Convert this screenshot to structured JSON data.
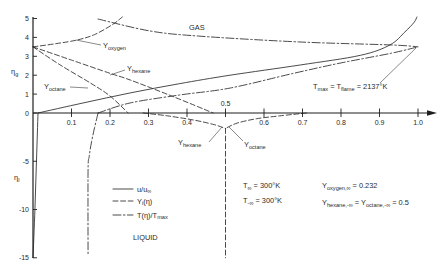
{
  "chart_data": {
    "type": "line",
    "title": "",
    "xlabel": "",
    "ylabel": "η",
    "ylabel_gas": {
      "main": "η",
      "sub": "g"
    },
    "ylabel_liquid": {
      "main": "η",
      "sub": "l"
    },
    "xlim": [
      0,
      1.0
    ],
    "ylim": [
      -15,
      5
    ],
    "grid": false,
    "legend_position": "lower-left-center",
    "x_ticks": [
      {
        "value": 0.1,
        "label": "0.1"
      },
      {
        "value": 0.2,
        "label": "0.2"
      },
      {
        "value": 0.3,
        "label": "0.3"
      },
      {
        "value": 0.4,
        "label": "0.4"
      },
      {
        "value": 0.5,
        "label": "0.5",
        "label_above": true
      },
      {
        "value": 0.6,
        "label": "0.6"
      },
      {
        "value": 0.7,
        "label": "0.7"
      },
      {
        "value": 0.8,
        "label": "0.8"
      },
      {
        "value": 0.9,
        "label": "0.9"
      },
      {
        "value": 1.0,
        "label": "1.0"
      }
    ],
    "y_ticks": [
      {
        "value": 5,
        "label": "5"
      },
      {
        "value": 4,
        "label": "4"
      },
      {
        "value": 3,
        "label": "3"
      },
      {
        "value": 2,
        "label": "2"
      },
      {
        "value": 1,
        "label": "1"
      },
      {
        "value": 0,
        "label": "0"
      },
      {
        "value": -5,
        "label": "-5"
      },
      {
        "value": -10,
        "label": "-10"
      },
      {
        "value": -15,
        "label": "-15"
      }
    ],
    "series": [
      {
        "name": "u/u∞ (gas)",
        "style": "solid",
        "points": [
          [
            0.013,
            0
          ],
          [
            0.13,
            0.53
          ],
          [
            0.252,
            1.06
          ],
          [
            0.38,
            1.55
          ],
          [
            0.512,
            2.0
          ],
          [
            0.694,
            2.54
          ],
          [
            0.85,
            3.05
          ],
          [
            0.927,
            3.6
          ],
          [
            0.966,
            4.29
          ],
          [
            0.99,
            4.8
          ],
          [
            0.997,
            5.08
          ]
        ]
      },
      {
        "name": "u/u∞ (liquid)",
        "style": "solid",
        "points": [
          [
            0.013,
            0
          ],
          [
            0.009,
            -5
          ],
          [
            0.005,
            -10
          ],
          [
            0.0,
            -15
          ]
        ]
      },
      {
        "name": "T(η)/Tmax (gas, above flame)",
        "style": "dashdot",
        "points": [
          [
            0.169,
            4.97
          ],
          [
            0.304,
            4.34
          ],
          [
            0.43,
            4.07
          ],
          [
            0.69,
            3.76
          ],
          [
            0.93,
            3.6
          ],
          [
            1.0,
            3.5
          ]
        ]
      },
      {
        "name": "T(η)/Tmax (gas, below flame)",
        "style": "dashdot",
        "points": [
          [
            0.169,
            0
          ],
          [
            0.252,
            0.53
          ],
          [
            0.38,
            0.95
          ],
          [
            0.512,
            1.32
          ],
          [
            0.677,
            2.1
          ],
          [
            0.8,
            2.65
          ],
          [
            0.93,
            3.16
          ],
          [
            1.0,
            3.5
          ]
        ]
      },
      {
        "name": "T(η)/Tmax (liquid)",
        "style": "dashdot",
        "points": [
          [
            0.169,
            0
          ],
          [
            0.16,
            -1.5
          ],
          [
            0.152,
            -3
          ],
          [
            0.146,
            -4.5
          ],
          [
            0.143,
            -6
          ],
          [
            0.143,
            -14.6
          ]
        ]
      },
      {
        "name": "Y oxygen (gas)",
        "style": "dashed",
        "points": [
          [
            0,
            3.5
          ],
          [
            0.06,
            3.67
          ],
          [
            0.114,
            3.86
          ],
          [
            0.16,
            4.15
          ],
          [
            0.208,
            4.7
          ],
          [
            0.232,
            5.08
          ]
        ]
      },
      {
        "name": "Y hexane (gas)",
        "style": "dashed",
        "points": [
          [
            0,
            3.5
          ],
          [
            0.1,
            2.8
          ],
          [
            0.2,
            2.1
          ],
          [
            0.252,
            1.75
          ],
          [
            0.36,
            0.9
          ],
          [
            0.468,
            0
          ]
        ]
      },
      {
        "name": "Y octane (gas)",
        "style": "dashed",
        "points": [
          [
            0,
            3.5
          ],
          [
            0.07,
            2.55
          ],
          [
            0.148,
            1.6
          ],
          [
            0.2,
            0.9
          ],
          [
            0.247,
            0
          ]
        ]
      },
      {
        "name": "Y hexane (liquid)",
        "style": "dashed",
        "points": [
          [
            0.286,
            0
          ],
          [
            0.35,
            -0.3
          ],
          [
            0.42,
            -0.75
          ],
          [
            0.47,
            -1.2
          ],
          [
            0.5,
            -1.6
          ]
        ]
      },
      {
        "name": "Y octane (liquid)",
        "style": "dashed",
        "points": [
          [
            0.71,
            0
          ],
          [
            0.64,
            -0.3
          ],
          [
            0.58,
            -0.6
          ],
          [
            0.53,
            -1.05
          ],
          [
            0.5,
            -1.6
          ]
        ]
      },
      {
        "name": "Y hexane = Y octane (liquid far field)",
        "style": "dashed",
        "points": [
          [
            0.5,
            -1.6
          ],
          [
            0.5,
            -15
          ]
        ]
      }
    ],
    "annotations": {
      "gas": "GAS",
      "liquid": "LIQUID",
      "y_oxygen": {
        "main": "Y",
        "sub": "oxygen"
      },
      "y_hexane_gas": {
        "main": "Y",
        "sub": "hexane"
      },
      "y_octane_gas": {
        "main": "Y",
        "sub": "octane"
      },
      "y_hexane_liquid": {
        "main": "Y",
        "sub": "hexane"
      },
      "y_octane_liquid": {
        "main": "Y",
        "sub": "octane"
      },
      "t_max": {
        "t1": "T",
        "sub1": "max",
        "mid": " = T",
        "sub2": "flame",
        "rest": " = 2137°K"
      },
      "t_inf": {
        "main": "T",
        "sub": "∞",
        "rest": " = 300°K"
      },
      "t_minus_inf": {
        "main": "T",
        "sub": "-∞",
        "rest": " = 300°K"
      },
      "y_oxygen_inf": {
        "main": "Y",
        "sub": "oxygen,∞",
        "rest": " = 0.232"
      },
      "y_liquid_inf": {
        "main1": "Y",
        "sub1": "hexane,-∞",
        "mid": " = Y",
        "sub2": "octane,-∞",
        "rest": " = 0.5"
      }
    },
    "legend": [
      {
        "style": "solid",
        "main": "u/u",
        "sub": "∞",
        "rest": ""
      },
      {
        "style": "dashed",
        "main": "Y",
        "sub": "i",
        "rest": "(η)"
      },
      {
        "style": "dashdot",
        "main": "T(η)/T",
        "sub": "max",
        "rest": ""
      }
    ]
  }
}
